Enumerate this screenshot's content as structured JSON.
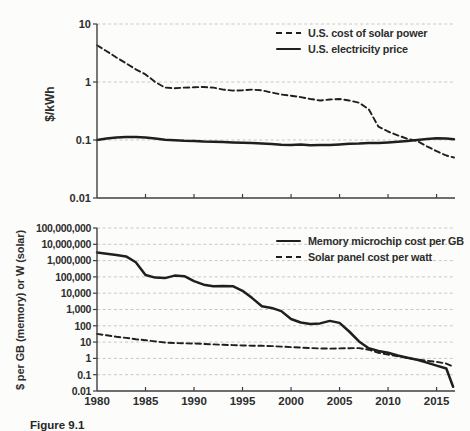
{
  "figure": {
    "caption": "Figure 9.1"
  },
  "colors": {
    "line": "#1f1f1f",
    "grid": "#c8c8c8",
    "axis": "#3f3f3f",
    "text": "#2d2d2d",
    "background": "#fcfcfb"
  },
  "chart_data": [
    {
      "type": "line",
      "title": "",
      "ylabel": "$/kWh",
      "xlabel": "",
      "ylim": [
        0.01,
        10
      ],
      "xlim": [
        1980,
        2016.9
      ],
      "yscale": "log",
      "grid": "horizontal-dashed",
      "yticks": [
        10,
        1,
        0.1,
        0.01
      ],
      "ytick_labels": [
        "10",
        "1",
        "0.1",
        "0.01"
      ],
      "xticks": [
        1985,
        1990,
        1995,
        2000,
        2005,
        2010,
        2015
      ],
      "show_x_labels": false,
      "legend_position": "top-right",
      "series": [
        {
          "name": "U.S. cost of solar power",
          "style": "dashed",
          "x": [
            1980,
            1981,
            1982,
            1983,
            1984,
            1985,
            1986,
            1987,
            1988,
            1989,
            1990,
            1991,
            1992,
            1993,
            1994,
            1995,
            1996,
            1997,
            1998,
            1999,
            2000,
            2001,
            2002,
            2003,
            2004,
            2005,
            2006,
            2007,
            2008,
            2009,
            2010,
            2011,
            2012,
            2013,
            2014,
            2015,
            2016,
            2016.8
          ],
          "y": [
            4.3,
            3.4,
            2.65,
            2.1,
            1.65,
            1.35,
            1.0,
            0.8,
            0.78,
            0.8,
            0.81,
            0.82,
            0.8,
            0.74,
            0.71,
            0.72,
            0.74,
            0.72,
            0.66,
            0.61,
            0.58,
            0.55,
            0.51,
            0.48,
            0.5,
            0.51,
            0.48,
            0.44,
            0.34,
            0.17,
            0.14,
            0.12,
            0.105,
            0.096,
            0.078,
            0.064,
            0.054,
            0.05
          ]
        },
        {
          "name": "U.S. electricity price",
          "style": "solid",
          "x": [
            1980,
            1981,
            1982,
            1983,
            1984,
            1985,
            1986,
            1987,
            1988,
            1989,
            1990,
            1991,
            1992,
            1993,
            1994,
            1995,
            1996,
            1997,
            1998,
            1999,
            2000,
            2001,
            2002,
            2003,
            2004,
            2005,
            2006,
            2007,
            2008,
            2009,
            2010,
            2011,
            2012,
            2013,
            2014,
            2015,
            2016,
            2016.8
          ],
          "y": [
            0.1,
            0.106,
            0.111,
            0.113,
            0.112,
            0.11,
            0.106,
            0.101,
            0.099,
            0.097,
            0.096,
            0.094,
            0.093,
            0.092,
            0.091,
            0.09,
            0.089,
            0.087,
            0.085,
            0.083,
            0.082,
            0.084,
            0.081,
            0.082,
            0.082,
            0.084,
            0.086,
            0.087,
            0.089,
            0.089,
            0.091,
            0.093,
            0.096,
            0.1,
            0.104,
            0.107,
            0.106,
            0.103
          ]
        }
      ]
    },
    {
      "type": "line",
      "title": "",
      "ylabel": "$ per GB (memory) or W (solar)",
      "xlabel": "",
      "ylim": [
        0.01,
        100000000
      ],
      "xlim": [
        1980,
        2016.9
      ],
      "yscale": "log",
      "grid": "horizontal-dashed",
      "yticks": [
        100000000,
        10000000,
        1000000,
        100000,
        10000,
        1000,
        100,
        10,
        1,
        0.1,
        0.01
      ],
      "ytick_labels": [
        "100,000,000",
        "10,000,000",
        "1,000,000",
        "100,000",
        "10,000",
        "1,000",
        "100",
        "10",
        "1",
        "0.1",
        "0.01"
      ],
      "xticks": [
        1985,
        1990,
        1995,
        2000,
        2005,
        2010,
        2015
      ],
      "show_x_labels": true,
      "xtick_label_years": [
        1980,
        1985,
        1990,
        1995,
        2000,
        2005,
        2010,
        2015
      ],
      "xtick_labels": [
        "1980",
        "1985",
        "1990",
        "1995",
        "2000",
        "2005",
        "2010",
        "2015"
      ],
      "legend_position": "top-right",
      "series": [
        {
          "name": "Memory microchip cost per GB",
          "style": "solid",
          "x": [
            1980,
            1981,
            1982,
            1983,
            1984,
            1985,
            1986,
            1987,
            1988,
            1989,
            1990,
            1991,
            1992,
            1993,
            1994,
            1995,
            1996,
            1997,
            1998,
            1999,
            2000,
            2001,
            2002,
            2003,
            2004,
            2005,
            2006,
            2007,
            2008,
            2009,
            2010,
            2011,
            2012,
            2013,
            2014,
            2015,
            2016,
            2016.7
          ],
          "y": [
            3200000,
            2600000,
            2200000,
            1800000,
            800000,
            130000,
            90000,
            85000,
            120000,
            110000,
            55000,
            33000,
            27000,
            28000,
            27000,
            14000,
            5000,
            1600,
            1250,
            800,
            260,
            160,
            130,
            140,
            200,
            150,
            45,
            11,
            4.2,
            2.9,
            2.2,
            1.5,
            1.1,
            0.82,
            0.55,
            0.36,
            0.24,
            0.018
          ]
        },
        {
          "name": "Solar panel cost per watt",
          "style": "dashed",
          "x": [
            1980,
            1981,
            1982,
            1983,
            1984,
            1985,
            1986,
            1987,
            1988,
            1989,
            1990,
            1991,
            1992,
            1993,
            1994,
            1995,
            1996,
            1997,
            1998,
            1999,
            2000,
            2001,
            2002,
            2003,
            2004,
            2005,
            2006,
            2007,
            2008,
            2009,
            2010,
            2011,
            2012,
            2013,
            2014,
            2015,
            2016,
            2016.7
          ],
          "y": [
            32,
            26,
            21,
            18,
            15,
            13,
            11,
            9.5,
            8.8,
            8.5,
            8.2,
            7.8,
            7.2,
            6.8,
            6.5,
            6.2,
            6.0,
            5.9,
            5.7,
            5.3,
            4.9,
            4.6,
            4.3,
            4.1,
            4.0,
            4.1,
            4.2,
            4.3,
            3.4,
            2.2,
            1.7,
            1.35,
            1.08,
            0.85,
            0.72,
            0.62,
            0.48,
            0.32
          ]
        }
      ]
    }
  ]
}
